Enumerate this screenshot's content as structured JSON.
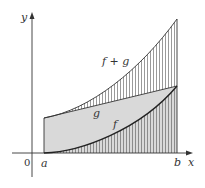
{
  "diagram": {
    "type": "function-sum-area",
    "axes": {
      "x_label": "x",
      "y_label": "y",
      "origin_label": "0"
    },
    "interval": {
      "start_label": "a",
      "end_label": "b"
    },
    "curves": [
      {
        "name": "f",
        "label": "f",
        "description": "increasing convex curve from 0 at a"
      },
      {
        "name": "g",
        "label": "g",
        "description": "straight increasing line"
      },
      {
        "name": "f+g",
        "label": "f + g",
        "description": "sum curve, top boundary"
      }
    ],
    "regions": [
      {
        "name": "area-under-f",
        "fill": "vertical hatching"
      },
      {
        "name": "area-under-g",
        "fill": "#d9d9d9"
      },
      {
        "name": "area-between-g-and-f+g",
        "fill": "vertical hatching"
      }
    ],
    "colors": {
      "shade": "#d9d9d9",
      "line": "#333333",
      "hatch": "#555555"
    }
  }
}
